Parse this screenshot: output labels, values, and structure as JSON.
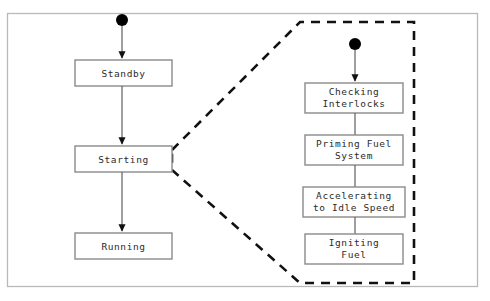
{
  "diagram": {
    "type": "uml-state-machine",
    "title": "",
    "frame": {
      "x": 7,
      "y": 13,
      "width": 471,
      "height": 274,
      "border_color": "#b9b9b9"
    },
    "colors": {
      "background": "#ffffff",
      "box_stroke": "#8a8a8a",
      "box_fill": "#ffffff",
      "text": "#2b2b2b",
      "transition": "#5f5f5f",
      "initial_node": "#000000",
      "region_outline": "#111111"
    },
    "main_region": {
      "name": "engine-states",
      "initial_node": {
        "cx": 122,
        "cy": 20,
        "r": 6
      },
      "states": [
        {
          "id": "standby",
          "label": "Standby",
          "x": 75,
          "y": 60,
          "width": 97,
          "height": 26,
          "lines": [
            "Standby"
          ]
        },
        {
          "id": "starting",
          "label": "Starting",
          "x": 75,
          "y": 146,
          "width": 97,
          "height": 26,
          "lines": [
            "Starting"
          ]
        },
        {
          "id": "running",
          "label": "Running",
          "x": 75,
          "y": 233,
          "width": 97,
          "height": 26,
          "lines": [
            "Running"
          ]
        }
      ],
      "transitions": [
        {
          "from": "initial",
          "to": "standby",
          "arrowhead": true
        },
        {
          "from": "standby",
          "to": "starting",
          "arrowhead": true
        },
        {
          "from": "starting",
          "to": "running",
          "arrowhead": true
        }
      ]
    },
    "expanded_region": {
      "name": "starting-substates",
      "source_state": "starting",
      "outline_style": "dashed",
      "polygon_points": "172,150 300,22 414,22 414,283 300,283 172,170",
      "initial_node": {
        "cx": 355,
        "cy": 44,
        "r": 6
      },
      "states": [
        {
          "id": "checking-interlocks",
          "label": "Checking Interlocks",
          "x": 305,
          "y": 83,
          "width": 98,
          "height": 30,
          "lines": [
            "Checking",
            "Interlocks"
          ]
        },
        {
          "id": "priming-fuel-system",
          "label": "Priming Fuel System",
          "x": 305,
          "y": 135,
          "width": 98,
          "height": 30,
          "lines": [
            "Priming Fuel",
            "System"
          ]
        },
        {
          "id": "accelerating-to-idle-speed",
          "label": "Accelerating to Idle Speed",
          "x": 303,
          "y": 187,
          "width": 102,
          "height": 30,
          "lines": [
            "Accelerating",
            "to Idle Speed"
          ]
        },
        {
          "id": "igniting-fuel",
          "label": "Igniting Fuel",
          "x": 305,
          "y": 234,
          "width": 98,
          "height": 30,
          "lines": [
            "Igniting",
            "Fuel"
          ]
        }
      ],
      "transitions": [
        {
          "from": "initial",
          "to": "checking-interlocks",
          "arrowhead": true
        },
        {
          "from": "checking-interlocks",
          "to": "priming-fuel-system",
          "arrowhead": false
        },
        {
          "from": "priming-fuel-system",
          "to": "accelerating-to-idle-speed",
          "arrowhead": false
        },
        {
          "from": "accelerating-to-idle-speed",
          "to": "igniting-fuel",
          "arrowhead": false
        }
      ]
    }
  }
}
